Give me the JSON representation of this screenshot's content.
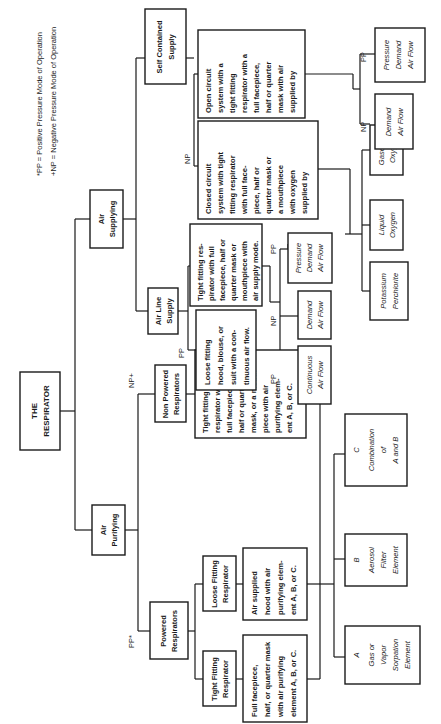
{
  "legend": {
    "pp": "*PP = Positive Pressure Mode of Operation",
    "np": "+NP = Negative Pressure Mode of Operation"
  },
  "root": {
    "lines": [
      "THE",
      "RESPIRATOR"
    ]
  },
  "air_purifying": {
    "title": [
      "Air",
      "Purifying"
    ],
    "powered": {
      "mode": "PP*",
      "title": [
        "Powered",
        "Respirators"
      ],
      "tight_fitting": {
        "title": [
          "Tight Fitting",
          "Respirator"
        ],
        "desc": [
          "Full facepiece,",
          "half, or quarter mask",
          "with air purifying",
          "element A, B, or C."
        ]
      },
      "loose_fitting": {
        "title": [
          "Loose Fitting",
          "Respirator"
        ],
        "desc": [
          "Air supplied",
          "hood with air",
          "purifying elem-",
          "ent A, B, or C."
        ]
      }
    },
    "non_powered": {
      "mode": "NP+",
      "title": [
        "Non Powered",
        "Respirators"
      ],
      "desc": [
        "Tight fitting",
        "respirator with a",
        "full facepiece,",
        "half or quarter",
        "mask, or a mouth-",
        "piece with air",
        "purifying elem-",
        "ent A, B, or C."
      ]
    },
    "elements": [
      {
        "letter": "A",
        "lines": [
          "Gas or",
          "Vapor",
          "Sorpation",
          "Element"
        ]
      },
      {
        "letter": "B",
        "lines": [
          "Aerosol",
          "Filter",
          "Element"
        ]
      },
      {
        "letter": "C",
        "lines": [
          "Combination",
          "of",
          "A and B"
        ]
      }
    ]
  },
  "air_supplying": {
    "title": [
      "Air",
      "Supplying"
    ],
    "air_line": {
      "title": [
        "Air Line",
        "Supply"
      ],
      "loose": {
        "mode": "PP",
        "desc": [
          "Loose fitting",
          "hood, blouse, or",
          "suit with a con-",
          "tinuous air flow."
        ]
      },
      "tight": {
        "desc": [
          "Tight fitting res-",
          "pirator with full",
          "facepiece, half or",
          "quarter mask or",
          "mouthpiece with",
          "air supply mode."
        ]
      },
      "modes": [
        {
          "mode": "PP",
          "lines": [
            "Continuous",
            "Air Flow"
          ]
        },
        {
          "mode": "NP",
          "lines": [
            "Demand",
            "Air Flow"
          ]
        },
        {
          "mode": "PP",
          "lines": [
            "Pressure",
            "Demand",
            "Air Flow"
          ]
        }
      ]
    },
    "self_contained": {
      "title": [
        "Self Contained",
        "Supply"
      ],
      "closed": {
        "mode": "NP",
        "desc": [
          "Closed circuit",
          "system with tight",
          "fitting respirator",
          "with full face-",
          "piece, half or",
          "quarter mask or",
          "a mouthpiece",
          "with oxygen",
          "supplied by"
        ]
      },
      "open": {
        "desc": [
          "Open circuit",
          "system with a",
          "tight fitting",
          "respirator with a",
          "full facepiece,",
          "half or quarter",
          "mask with air",
          "supplied by"
        ]
      },
      "oxygen_sources": [
        {
          "lines": [
            "Potassium",
            "Perchlorite"
          ]
        },
        {
          "lines": [
            "Liquid",
            "Oxygen"
          ]
        },
        {
          "lines": [
            "Gaseous",
            "Oxygen"
          ]
        }
      ],
      "open_modes": [
        {
          "mode": "NP",
          "lines": [
            "Demand",
            "Air Flow"
          ]
        },
        {
          "mode": "PP",
          "lines": [
            "Pressure",
            "Demand",
            "Air Flow"
          ]
        }
      ]
    }
  }
}
